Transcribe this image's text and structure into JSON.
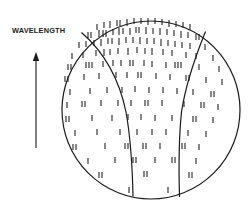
{
  "figure": {
    "type": "line-art-diagram",
    "background_color": "#ffffff",
    "ink_color": "#1a1a1a"
  },
  "axis": {
    "label": "WAVELENGTH",
    "label_x": 12,
    "label_y": 26,
    "arrow": {
      "direction": "up",
      "shaft_x": 36,
      "shaft_top_y": 52,
      "shaft_bottom_y": 148,
      "head_half_width": 3.2,
      "head_height": 9,
      "stroke_width": 1.1
    }
  },
  "circle": {
    "center_x": 151,
    "center_y": 110,
    "radius": 89,
    "stroke_width": 1.2,
    "fill": "none"
  },
  "dividers": [
    {
      "name": "left-divider",
      "path": "M 81.5 32.5 C 104 52, 119 78, 126 112 C 131 140, 132.5 172, 133 196.5"
    },
    {
      "name": "right-divider",
      "path": "M 205.5 31.5 C 196 55, 186 82, 181.5 112 C 178.5 141, 178.8 173, 179.5 197"
    }
  ],
  "ticks": {
    "stroke_width": 1.05,
    "marks": [
      {
        "x": 97,
        "y": 24,
        "h": 6
      },
      {
        "x": 104,
        "y": 22,
        "h": 6
      },
      {
        "x": 110,
        "y": 21,
        "h": 7
      },
      {
        "x": 117,
        "y": 20,
        "h": 6
      },
      {
        "x": 120,
        "y": 20,
        "h": 6
      },
      {
        "x": 127,
        "y": 19,
        "h": 7
      },
      {
        "x": 134,
        "y": 18,
        "h": 6
      },
      {
        "x": 141,
        "y": 18,
        "h": 6
      },
      {
        "x": 148,
        "y": 18,
        "h": 7
      },
      {
        "x": 155,
        "y": 18,
        "h": 6
      },
      {
        "x": 162,
        "y": 19,
        "h": 6
      },
      {
        "x": 169,
        "y": 20,
        "h": 7
      },
      {
        "x": 176,
        "y": 21,
        "h": 6
      },
      {
        "x": 183,
        "y": 22,
        "h": 6
      },
      {
        "x": 190,
        "y": 24,
        "h": 6
      },
      {
        "x": 88,
        "y": 32,
        "h": 6
      },
      {
        "x": 91,
        "y": 32,
        "h": 6
      },
      {
        "x": 99,
        "y": 30,
        "h": 7
      },
      {
        "x": 103,
        "y": 30,
        "h": 7
      },
      {
        "x": 106,
        "y": 30,
        "h": 7
      },
      {
        "x": 113,
        "y": 29,
        "h": 6
      },
      {
        "x": 119,
        "y": 28,
        "h": 7
      },
      {
        "x": 123,
        "y": 28,
        "h": 6
      },
      {
        "x": 130,
        "y": 28,
        "h": 7
      },
      {
        "x": 136,
        "y": 27,
        "h": 6
      },
      {
        "x": 139,
        "y": 27,
        "h": 6
      },
      {
        "x": 146,
        "y": 27,
        "h": 7
      },
      {
        "x": 153,
        "y": 28,
        "h": 6
      },
      {
        "x": 160,
        "y": 28,
        "h": 7
      },
      {
        "x": 167,
        "y": 29,
        "h": 6
      },
      {
        "x": 174,
        "y": 30,
        "h": 6
      },
      {
        "x": 181,
        "y": 31,
        "h": 7
      },
      {
        "x": 188,
        "y": 32,
        "h": 6
      },
      {
        "x": 196,
        "y": 34,
        "h": 6
      },
      {
        "x": 199,
        "y": 34,
        "h": 6
      },
      {
        "x": 79,
        "y": 42,
        "h": 6
      },
      {
        "x": 86,
        "y": 41,
        "h": 6
      },
      {
        "x": 94,
        "y": 40,
        "h": 6
      },
      {
        "x": 101,
        "y": 39,
        "h": 7
      },
      {
        "x": 108,
        "y": 38,
        "h": 6
      },
      {
        "x": 112,
        "y": 38,
        "h": 6
      },
      {
        "x": 119,
        "y": 38,
        "h": 7
      },
      {
        "x": 126,
        "y": 37,
        "h": 6
      },
      {
        "x": 133,
        "y": 37,
        "h": 6
      },
      {
        "x": 140,
        "y": 37,
        "h": 7
      },
      {
        "x": 147,
        "y": 38,
        "h": 6
      },
      {
        "x": 154,
        "y": 38,
        "h": 6
      },
      {
        "x": 161,
        "y": 39,
        "h": 7
      },
      {
        "x": 168,
        "y": 40,
        "h": 6
      },
      {
        "x": 175,
        "y": 41,
        "h": 6
      },
      {
        "x": 182,
        "y": 42,
        "h": 6
      },
      {
        "x": 190,
        "y": 43,
        "h": 6
      },
      {
        "x": 205,
        "y": 44,
        "h": 6
      },
      {
        "x": 72,
        "y": 53,
        "h": 6
      },
      {
        "x": 83,
        "y": 52,
        "h": 6
      },
      {
        "x": 96,
        "y": 50,
        "h": 6
      },
      {
        "x": 104,
        "y": 49,
        "h": 7
      },
      {
        "x": 110,
        "y": 49,
        "h": 6
      },
      {
        "x": 118,
        "y": 48,
        "h": 6
      },
      {
        "x": 128,
        "y": 48,
        "h": 7
      },
      {
        "x": 137,
        "y": 47,
        "h": 6
      },
      {
        "x": 145,
        "y": 48,
        "h": 6
      },
      {
        "x": 152,
        "y": 48,
        "h": 7
      },
      {
        "x": 163,
        "y": 49,
        "h": 6
      },
      {
        "x": 172,
        "y": 50,
        "h": 6
      },
      {
        "x": 186,
        "y": 52,
        "h": 6
      },
      {
        "x": 196,
        "y": 53,
        "h": 6
      },
      {
        "x": 213,
        "y": 55,
        "h": 6
      },
      {
        "x": 68,
        "y": 64,
        "h": 6
      },
      {
        "x": 71,
        "y": 64,
        "h": 6
      },
      {
        "x": 86,
        "y": 62,
        "h": 6
      },
      {
        "x": 89,
        "y": 62,
        "h": 6
      },
      {
        "x": 92,
        "y": 62,
        "h": 6
      },
      {
        "x": 103,
        "y": 61,
        "h": 6
      },
      {
        "x": 113,
        "y": 60,
        "h": 6
      },
      {
        "x": 121,
        "y": 60,
        "h": 6
      },
      {
        "x": 130,
        "y": 60,
        "h": 6
      },
      {
        "x": 133,
        "y": 60,
        "h": 6
      },
      {
        "x": 144,
        "y": 60,
        "h": 6
      },
      {
        "x": 152,
        "y": 61,
        "h": 6
      },
      {
        "x": 166,
        "y": 62,
        "h": 6
      },
      {
        "x": 175,
        "y": 62,
        "h": 6
      },
      {
        "x": 178,
        "y": 62,
        "h": 6
      },
      {
        "x": 181,
        "y": 62,
        "h": 6
      },
      {
        "x": 199,
        "y": 64,
        "h": 6
      },
      {
        "x": 219,
        "y": 66,
        "h": 6
      },
      {
        "x": 65,
        "y": 76,
        "h": 6
      },
      {
        "x": 68,
        "y": 76,
        "h": 6
      },
      {
        "x": 84,
        "y": 74,
        "h": 6
      },
      {
        "x": 99,
        "y": 73,
        "h": 6
      },
      {
        "x": 116,
        "y": 72,
        "h": 6
      },
      {
        "x": 127,
        "y": 72,
        "h": 6
      },
      {
        "x": 138,
        "y": 72,
        "h": 6
      },
      {
        "x": 141,
        "y": 72,
        "h": 6
      },
      {
        "x": 156,
        "y": 73,
        "h": 6
      },
      {
        "x": 170,
        "y": 74,
        "h": 6
      },
      {
        "x": 186,
        "y": 75,
        "h": 6
      },
      {
        "x": 189,
        "y": 75,
        "h": 6
      },
      {
        "x": 206,
        "y": 77,
        "h": 6
      },
      {
        "x": 222,
        "y": 79,
        "h": 6
      },
      {
        "x": 70,
        "y": 89,
        "h": 6
      },
      {
        "x": 90,
        "y": 88,
        "h": 6
      },
      {
        "x": 107,
        "y": 87,
        "h": 6
      },
      {
        "x": 122,
        "y": 87,
        "h": 6
      },
      {
        "x": 135,
        "y": 86,
        "h": 6
      },
      {
        "x": 149,
        "y": 87,
        "h": 6
      },
      {
        "x": 163,
        "y": 87,
        "h": 6
      },
      {
        "x": 177,
        "y": 88,
        "h": 6
      },
      {
        "x": 193,
        "y": 89,
        "h": 6
      },
      {
        "x": 211,
        "y": 91,
        "h": 6
      },
      {
        "x": 214,
        "y": 91,
        "h": 6
      },
      {
        "x": 67,
        "y": 102,
        "h": 6
      },
      {
        "x": 82,
        "y": 101,
        "h": 6
      },
      {
        "x": 85,
        "y": 101,
        "h": 6
      },
      {
        "x": 101,
        "y": 100,
        "h": 6
      },
      {
        "x": 118,
        "y": 100,
        "h": 6
      },
      {
        "x": 131,
        "y": 100,
        "h": 6
      },
      {
        "x": 145,
        "y": 100,
        "h": 6
      },
      {
        "x": 148,
        "y": 100,
        "h": 6
      },
      {
        "x": 162,
        "y": 100,
        "h": 6
      },
      {
        "x": 184,
        "y": 101,
        "h": 6
      },
      {
        "x": 201,
        "y": 102,
        "h": 6
      },
      {
        "x": 204,
        "y": 102,
        "h": 6
      },
      {
        "x": 218,
        "y": 104,
        "h": 6
      },
      {
        "x": 66,
        "y": 116,
        "h": 6
      },
      {
        "x": 69,
        "y": 116,
        "h": 6
      },
      {
        "x": 92,
        "y": 115,
        "h": 6
      },
      {
        "x": 112,
        "y": 115,
        "h": 6
      },
      {
        "x": 128,
        "y": 114,
        "h": 6
      },
      {
        "x": 141,
        "y": 114,
        "h": 6
      },
      {
        "x": 155,
        "y": 115,
        "h": 6
      },
      {
        "x": 172,
        "y": 115,
        "h": 6
      },
      {
        "x": 193,
        "y": 116,
        "h": 6
      },
      {
        "x": 196,
        "y": 116,
        "h": 6
      },
      {
        "x": 213,
        "y": 117,
        "h": 6
      },
      {
        "x": 75,
        "y": 130,
        "h": 6
      },
      {
        "x": 97,
        "y": 129,
        "h": 6
      },
      {
        "x": 120,
        "y": 129,
        "h": 6
      },
      {
        "x": 137,
        "y": 129,
        "h": 6
      },
      {
        "x": 152,
        "y": 129,
        "h": 6
      },
      {
        "x": 166,
        "y": 129,
        "h": 6
      },
      {
        "x": 188,
        "y": 130,
        "h": 6
      },
      {
        "x": 206,
        "y": 131,
        "h": 6
      },
      {
        "x": 73,
        "y": 144,
        "h": 6
      },
      {
        "x": 76,
        "y": 144,
        "h": 6
      },
      {
        "x": 105,
        "y": 143,
        "h": 6
      },
      {
        "x": 125,
        "y": 143,
        "h": 6
      },
      {
        "x": 128,
        "y": 143,
        "h": 6
      },
      {
        "x": 143,
        "y": 143,
        "h": 6
      },
      {
        "x": 146,
        "y": 143,
        "h": 6
      },
      {
        "x": 160,
        "y": 143,
        "h": 6
      },
      {
        "x": 182,
        "y": 143,
        "h": 6
      },
      {
        "x": 185,
        "y": 143,
        "h": 6
      },
      {
        "x": 199,
        "y": 144,
        "h": 6
      },
      {
        "x": 88,
        "y": 158,
        "h": 6
      },
      {
        "x": 115,
        "y": 157,
        "h": 6
      },
      {
        "x": 133,
        "y": 157,
        "h": 6
      },
      {
        "x": 136,
        "y": 157,
        "h": 6
      },
      {
        "x": 155,
        "y": 157,
        "h": 6
      },
      {
        "x": 172,
        "y": 157,
        "h": 6
      },
      {
        "x": 175,
        "y": 157,
        "h": 6
      },
      {
        "x": 196,
        "y": 158,
        "h": 6
      },
      {
        "x": 99,
        "y": 172,
        "h": 6
      },
      {
        "x": 102,
        "y": 172,
        "h": 6
      },
      {
        "x": 144,
        "y": 171,
        "h": 6
      },
      {
        "x": 147,
        "y": 171,
        "h": 6
      },
      {
        "x": 189,
        "y": 172,
        "h": 6
      },
      {
        "x": 192,
        "y": 172,
        "h": 6
      },
      {
        "x": 129,
        "y": 187,
        "h": 6
      },
      {
        "x": 168,
        "y": 187,
        "h": 6
      }
    ]
  }
}
